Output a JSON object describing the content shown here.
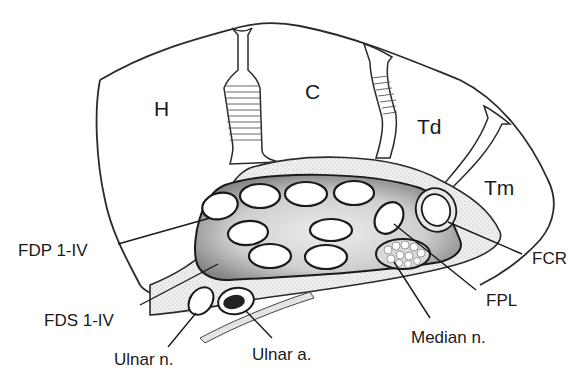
{
  "figure": {
    "background": "#ffffff",
    "colors": {
      "line": "#2a2a2a",
      "tunnel_shade_dark": "#8a8a8a",
      "tunnel_shade_light": "#e2e2e2",
      "artery_fill": "#222222"
    }
  },
  "regions": {
    "hamate": {
      "label": "H"
    },
    "capitate": {
      "label": "C"
    },
    "trapezoid": {
      "label": "Td"
    },
    "trapezium": {
      "label": "Tm"
    }
  },
  "callouts": {
    "fdp": {
      "label": "FDP 1-IV"
    },
    "fds": {
      "label": "FDS 1-IV"
    },
    "ulnar_nerve": {
      "label": "Ulnar n."
    },
    "ulnar_artery": {
      "label": "Ulnar a."
    },
    "median_nerve": {
      "label": "Median n."
    },
    "fpl": {
      "label": "FPL"
    },
    "fcr": {
      "label": "FCR"
    }
  }
}
